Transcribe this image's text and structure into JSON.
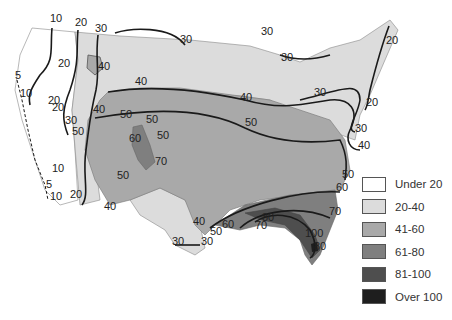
{
  "map": {
    "title": "",
    "region": "Contiguous United States",
    "contour_labels": [
      {
        "text": "10",
        "x": 50,
        "y": 22
      },
      {
        "text": "20",
        "x": 75,
        "y": 26
      },
      {
        "text": "30",
        "x": 95,
        "y": 32
      },
      {
        "text": "20",
        "x": 58,
        "y": 67
      },
      {
        "text": "40",
        "x": 98,
        "y": 70
      },
      {
        "text": "40",
        "x": 135,
        "y": 85
      },
      {
        "text": "30",
        "x": 180,
        "y": 43
      },
      {
        "text": "5",
        "x": 15,
        "y": 79
      },
      {
        "text": "10",
        "x": 20,
        "y": 97
      },
      {
        "text": "20",
        "x": 52,
        "y": 111
      },
      {
        "text": "20",
        "x": 48,
        "y": 104
      },
      {
        "text": "30",
        "x": 65,
        "y": 124
      },
      {
        "text": "40",
        "x": 93,
        "y": 113
      },
      {
        "text": "50",
        "x": 72,
        "y": 135
      },
      {
        "text": "50",
        "x": 120,
        "y": 118
      },
      {
        "text": "50",
        "x": 146,
        "y": 123
      },
      {
        "text": "50",
        "x": 157,
        "y": 139
      },
      {
        "text": "60",
        "x": 129,
        "y": 142
      },
      {
        "text": "70",
        "x": 155,
        "y": 165
      },
      {
        "text": "50",
        "x": 117,
        "y": 179
      },
      {
        "text": "10",
        "x": 52,
        "y": 172
      },
      {
        "text": "5",
        "x": 46,
        "y": 188
      },
      {
        "text": "10",
        "x": 50,
        "y": 200
      },
      {
        "text": "20",
        "x": 70,
        "y": 198
      },
      {
        "text": "40",
        "x": 104,
        "y": 210
      },
      {
        "text": "40",
        "x": 240,
        "y": 101
      },
      {
        "text": "50",
        "x": 245,
        "y": 126
      },
      {
        "text": "30",
        "x": 261,
        "y": 35
      },
      {
        "text": "30",
        "x": 281,
        "y": 61
      },
      {
        "text": "30",
        "x": 314,
        "y": 96
      },
      {
        "text": "20",
        "x": 386,
        "y": 44
      },
      {
        "text": "20",
        "x": 366,
        "y": 106
      },
      {
        "text": "30",
        "x": 355,
        "y": 132
      },
      {
        "text": "40",
        "x": 358,
        "y": 149
      },
      {
        "text": "50",
        "x": 342,
        "y": 178
      },
      {
        "text": "60",
        "x": 336,
        "y": 191
      },
      {
        "text": "70",
        "x": 329,
        "y": 215
      },
      {
        "text": "80",
        "x": 262,
        "y": 221
      },
      {
        "text": "70",
        "x": 255,
        "y": 229
      },
      {
        "text": "100",
        "x": 305,
        "y": 237
      },
      {
        "text": "80",
        "x": 314,
        "y": 250
      },
      {
        "text": "40",
        "x": 193,
        "y": 225
      },
      {
        "text": "50",
        "x": 210,
        "y": 235
      },
      {
        "text": "60",
        "x": 222,
        "y": 228
      },
      {
        "text": "30",
        "x": 172,
        "y": 245
      },
      {
        "text": "30",
        "x": 201,
        "y": 245
      }
    ]
  },
  "legend": {
    "items": [
      {
        "label": "Under 20",
        "color": "#ffffff"
      },
      {
        "label": "20-40",
        "color": "#dcdcdc"
      },
      {
        "label": "41-60",
        "color": "#a9a9a9"
      },
      {
        "label": "61-80",
        "color": "#7f7f7f"
      },
      {
        "label": "81-100",
        "color": "#4e4e4e"
      },
      {
        "label": "Over 100",
        "color": "#1e1e1e"
      }
    ]
  }
}
